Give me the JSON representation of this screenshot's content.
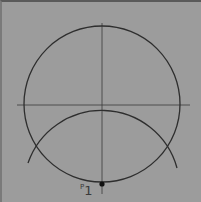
{
  "diagram": {
    "background": "#9c9c9c",
    "stroke": "#2e2e2e",
    "circle": {
      "cx": 100,
      "cy": 102,
      "r": 78
    },
    "arc": {
      "cx": 100,
      "cy": 181,
      "r": 78
    },
    "horizontal_axis": {
      "x1": 15,
      "x2": 188,
      "y": 103
    },
    "vertical_axis": {
      "x": 100,
      "y1": 21,
      "y2": 192
    },
    "point": {
      "cx": 100,
      "cy": 182
    },
    "point_label": {
      "prefix": "P",
      "text": "1"
    }
  }
}
